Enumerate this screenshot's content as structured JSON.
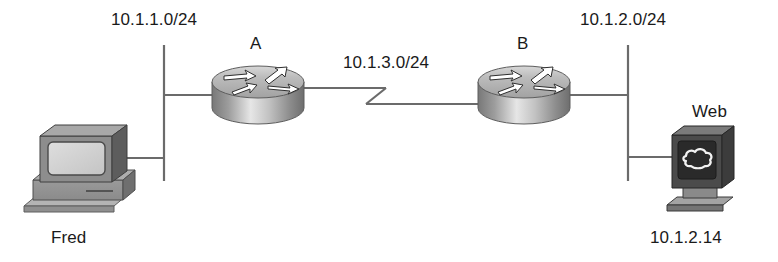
{
  "diagram": {
    "type": "network-topology",
    "title": "",
    "background_color": "#ffffff",
    "line_color": "#6b6b6b",
    "text_color": "#1a1a1a",
    "labels": {
      "subnet_left": "10.1.1.0/24",
      "subnet_serial": "10.1.3.0/24",
      "subnet_right": "10.1.2.0/24",
      "router_a": "A",
      "router_b": "B",
      "host_left": "Fred",
      "host_right": "Web",
      "host_right_address": "10.1.2.14"
    },
    "nodes": [
      {
        "id": "fred",
        "name": "Fred",
        "kind": "pc",
        "icon": "desktop-computer-icon",
        "x": 85,
        "y": 175
      },
      {
        "id": "router-a",
        "name": "A",
        "kind": "router",
        "icon": "router-icon",
        "x": 257,
        "y": 95
      },
      {
        "id": "router-b",
        "name": "B",
        "kind": "router",
        "icon": "router-icon",
        "x": 523,
        "y": 95
      },
      {
        "id": "web",
        "name": "Web",
        "kind": "server",
        "icon": "web-server-icon",
        "x": 700,
        "y": 175
      }
    ],
    "links": [
      {
        "id": "lan-left",
        "label": "10.1.1.0/24",
        "media": "ethernet-bus",
        "connects": [
          "fred",
          "router-a"
        ]
      },
      {
        "id": "wan-serial",
        "label": "10.1.3.0/24",
        "media": "serial",
        "connects": [
          "router-a",
          "router-b"
        ]
      },
      {
        "id": "lan-right",
        "label": "10.1.2.0/24",
        "media": "ethernet-bus",
        "connects": [
          "router-b",
          "web"
        ]
      }
    ]
  }
}
